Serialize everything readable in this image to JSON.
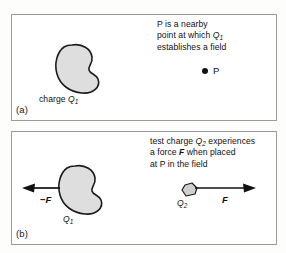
{
  "figure": {
    "background_color": "#fdfdfc",
    "border_color": "#9a9a9a",
    "blob_fill_color": "#dedede",
    "ink_color": "#111111"
  },
  "panel_a": {
    "label": "(a)",
    "caption_line1": "P is a nearby",
    "caption_line2_pre": "point at which ",
    "caption_line2_symbol": "Q",
    "caption_line2_subscript": "1",
    "caption_line3": "establishes a field",
    "charge_label_pre": "charge ",
    "charge_label_symbol": "Q",
    "charge_label_subscript": "1",
    "point_label": "P"
  },
  "panel_b": {
    "label": "(b)",
    "caption_line1_pre": "test charge ",
    "caption_line1_symbol": "Q",
    "caption_line1_subscript": "2",
    "caption_line1_post": " experiences",
    "caption_line2_pre": "a force ",
    "caption_line2_symbol": "F",
    "caption_line2_post": " when placed",
    "caption_line3": "at P in the field",
    "source_charge_symbol": "Q",
    "source_charge_subscript": "1",
    "test_charge_symbol": "Q",
    "test_charge_subscript": "2",
    "force_left_label": "−F",
    "force_right_label": "F"
  }
}
